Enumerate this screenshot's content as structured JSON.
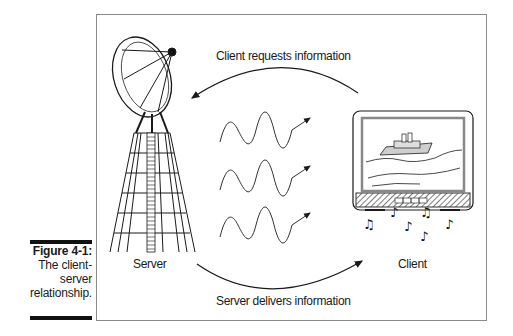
{
  "figure": {
    "number": "Figure 4-1:",
    "caption_lines": [
      "The client-",
      "server",
      "relationship."
    ]
  },
  "diagram": {
    "top_arrow_label": "Client requests information",
    "bottom_arrow_label": "Server delivers information",
    "server_label": "Server",
    "client_label": "Client",
    "signal_waves_count": 3,
    "colors": {
      "ink": "#1a1a1a",
      "frame": "#8a8a8a",
      "tv_hatch": "#555555",
      "ship": "#cfcfcf"
    }
  }
}
